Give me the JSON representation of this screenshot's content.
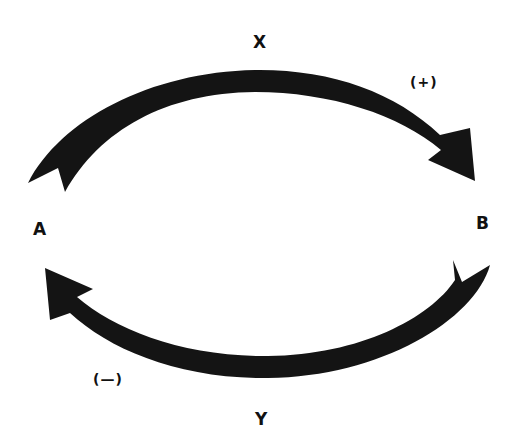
{
  "diagram": {
    "nodes": [
      {
        "id": "A",
        "label": "A"
      },
      {
        "id": "B",
        "label": "B"
      }
    ],
    "edges": [
      {
        "id": "X",
        "label": "X",
        "from": "A",
        "to": "B",
        "sign": "(+)",
        "position": "top"
      },
      {
        "id": "Y",
        "label": "Y",
        "from": "B",
        "to": "A",
        "sign": "(—)",
        "position": "bottom"
      }
    ],
    "colors": {
      "arrow": "#141414",
      "background": "#ffffff",
      "text": "#111111"
    }
  }
}
